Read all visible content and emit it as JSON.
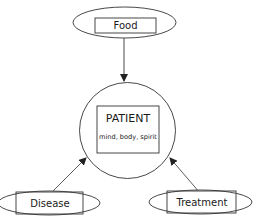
{
  "diagram": {
    "colors": {
      "stroke": "#333333",
      "background": "#ffffff",
      "text": "#1a1a1a"
    },
    "center": {
      "title": "PATIENT",
      "subtitle": "mind, body, spirit"
    },
    "inputs": [
      {
        "id": "food",
        "label": "Food",
        "position": "top"
      },
      {
        "id": "disease",
        "label": "Disease",
        "position": "bottom-left"
      },
      {
        "id": "treatment",
        "label": "Treatment",
        "position": "bottom-right"
      }
    ],
    "edges": [
      {
        "from": "food",
        "to": "patient"
      },
      {
        "from": "disease",
        "to": "patient"
      },
      {
        "from": "treatment",
        "to": "patient"
      }
    ]
  }
}
